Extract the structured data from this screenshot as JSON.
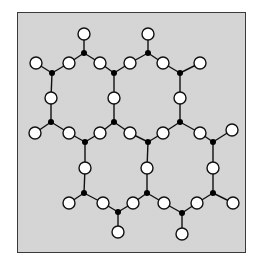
{
  "diagram": {
    "colors": {
      "background": "#ececec",
      "border": "#3a3a3a",
      "edge": "#111111",
      "open_node_fill": "#ffffff",
      "junction_fill": "#000000"
    },
    "open_radius": 6,
    "junction_radius": 3,
    "junctions": [
      {
        "id": "J1",
        "x": 84,
        "y": 53
      },
      {
        "id": "J2",
        "x": 148,
        "y": 53
      },
      {
        "id": "J3",
        "x": 52,
        "y": 73
      },
      {
        "id": "J4",
        "x": 114,
        "y": 73
      },
      {
        "id": "J5",
        "x": 180,
        "y": 73
      },
      {
        "id": "J6",
        "x": 51,
        "y": 122
      },
      {
        "id": "J7",
        "x": 114,
        "y": 122
      },
      {
        "id": "J8",
        "x": 180,
        "y": 122
      },
      {
        "id": "J9",
        "x": 85,
        "y": 142
      },
      {
        "id": "J10",
        "x": 148,
        "y": 142
      },
      {
        "id": "J11",
        "x": 213,
        "y": 142
      },
      {
        "id": "J12",
        "x": 84,
        "y": 193
      },
      {
        "id": "J13",
        "x": 147,
        "y": 193
      },
      {
        "id": "J14",
        "x": 213,
        "y": 193
      },
      {
        "id": "J15",
        "x": 118,
        "y": 212
      },
      {
        "id": "J16",
        "x": 182,
        "y": 213
      }
    ],
    "open_nodes": [
      {
        "id": "O1",
        "x": 84,
        "y": 34
      },
      {
        "id": "O2",
        "x": 148,
        "y": 34
      },
      {
        "id": "O3",
        "x": 36,
        "y": 63
      },
      {
        "id": "O4",
        "x": 69,
        "y": 63
      },
      {
        "id": "O5",
        "x": 100,
        "y": 63
      },
      {
        "id": "O6",
        "x": 130,
        "y": 63
      },
      {
        "id": "O7",
        "x": 163,
        "y": 63
      },
      {
        "id": "O8",
        "x": 200,
        "y": 63
      },
      {
        "id": "O9",
        "x": 51,
        "y": 98
      },
      {
        "id": "O10",
        "x": 114,
        "y": 98
      },
      {
        "id": "O11",
        "x": 180,
        "y": 98
      },
      {
        "id": "O12",
        "x": 35,
        "y": 133
      },
      {
        "id": "O13",
        "x": 69,
        "y": 133
      },
      {
        "id": "O14",
        "x": 100,
        "y": 133
      },
      {
        "id": "O15",
        "x": 130,
        "y": 133
      },
      {
        "id": "O16",
        "x": 163,
        "y": 133
      },
      {
        "id": "O17",
        "x": 200,
        "y": 133
      },
      {
        "id": "O18",
        "x": 232,
        "y": 130
      },
      {
        "id": "O19",
        "x": 85,
        "y": 168
      },
      {
        "id": "O20",
        "x": 147,
        "y": 168
      },
      {
        "id": "O21",
        "x": 213,
        "y": 168
      },
      {
        "id": "O22",
        "x": 69,
        "y": 203
      },
      {
        "id": "O23",
        "x": 103,
        "y": 203
      },
      {
        "id": "O24",
        "x": 133,
        "y": 203
      },
      {
        "id": "O25",
        "x": 164,
        "y": 203
      },
      {
        "id": "O26",
        "x": 197,
        "y": 203
      },
      {
        "id": "O27",
        "x": 233,
        "y": 203
      },
      {
        "id": "O28",
        "x": 118,
        "y": 232
      },
      {
        "id": "O29",
        "x": 182,
        "y": 234
      }
    ],
    "edges": [
      [
        "J1",
        "O1"
      ],
      [
        "J1",
        "O4"
      ],
      [
        "J1",
        "O5"
      ],
      [
        "J2",
        "O2"
      ],
      [
        "J2",
        "O6"
      ],
      [
        "J2",
        "O7"
      ],
      [
        "J3",
        "O3"
      ],
      [
        "J3",
        "O4"
      ],
      [
        "J3",
        "O9"
      ],
      [
        "J4",
        "O5"
      ],
      [
        "J4",
        "O6"
      ],
      [
        "J4",
        "O10"
      ],
      [
        "J5",
        "O7"
      ],
      [
        "J5",
        "O8"
      ],
      [
        "J5",
        "O11"
      ],
      [
        "J6",
        "O9"
      ],
      [
        "J6",
        "O12"
      ],
      [
        "J6",
        "O13"
      ],
      [
        "J7",
        "O10"
      ],
      [
        "J7",
        "O14"
      ],
      [
        "J7",
        "O15"
      ],
      [
        "J8",
        "O11"
      ],
      [
        "J8",
        "O16"
      ],
      [
        "J8",
        "O17"
      ],
      [
        "J9",
        "O13"
      ],
      [
        "J9",
        "O14"
      ],
      [
        "J9",
        "O19"
      ],
      [
        "J10",
        "O15"
      ],
      [
        "J10",
        "O16"
      ],
      [
        "J10",
        "O20"
      ],
      [
        "J11",
        "O17"
      ],
      [
        "J11",
        "O18"
      ],
      [
        "J11",
        "O21"
      ],
      [
        "J12",
        "O19"
      ],
      [
        "J12",
        "O22"
      ],
      [
        "J12",
        "O23"
      ],
      [
        "J13",
        "O20"
      ],
      [
        "J13",
        "O24"
      ],
      [
        "J13",
        "O25"
      ],
      [
        "J14",
        "O21"
      ],
      [
        "J14",
        "O26"
      ],
      [
        "J14",
        "O27"
      ],
      [
        "J15",
        "O23"
      ],
      [
        "J15",
        "O24"
      ],
      [
        "J15",
        "O28"
      ],
      [
        "J16",
        "O25"
      ],
      [
        "J16",
        "O26"
      ],
      [
        "J16",
        "O29"
      ]
    ]
  }
}
